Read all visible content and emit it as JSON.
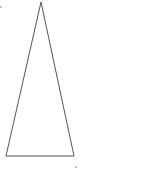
{
  "diagram": {
    "shape": "isosceles-triangle",
    "stroke_color": "#555555",
    "background": "#ffffff",
    "vertices": {
      "apex": [
        41,
        2
      ],
      "bottom_left": [
        6,
        156
      ],
      "bottom_right": [
        74,
        156
      ]
    },
    "marks": [
      {
        "x": 1,
        "y": 7
      },
      {
        "x": 76,
        "y": 167
      }
    ]
  }
}
